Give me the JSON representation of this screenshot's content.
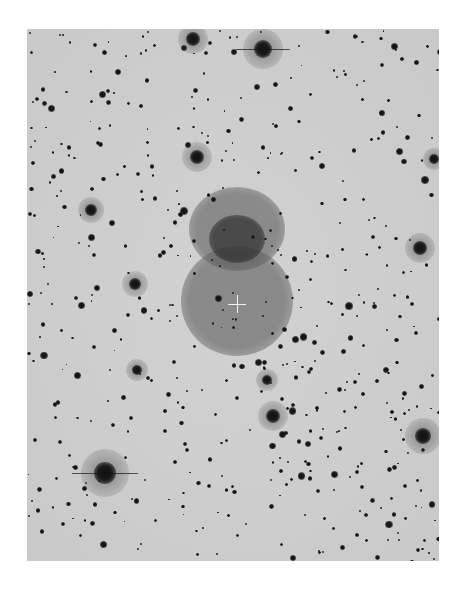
{
  "image": {
    "description": "Negative astronomical plate of a dense star field with a double-lobed diffuse nebula at center marked by a white crosshair",
    "background_color": "#cfcfcf",
    "frame": {
      "x": 27,
      "y": 29,
      "width": 412,
      "height": 532
    }
  },
  "crosshair": {
    "x": 210,
    "y": 275,
    "size": 18,
    "color": "#f2f2f2"
  },
  "nebula": [
    {
      "cx": 210,
      "cy": 200,
      "rx": 48,
      "ry": 42,
      "color": "rgba(80,80,80,0.55)"
    },
    {
      "cx": 210,
      "cy": 272,
      "rx": 56,
      "ry": 55,
      "color": "rgba(90,90,90,0.6)"
    },
    {
      "cx": 210,
      "cy": 210,
      "rx": 28,
      "ry": 24,
      "color": "rgba(40,40,40,0.65)"
    }
  ],
  "bright_stars": [
    {
      "x": 166,
      "y": 10,
      "r": 7,
      "spike": false
    },
    {
      "x": 236,
      "y": 20,
      "r": 9,
      "spike": true
    },
    {
      "x": 78,
      "y": 444,
      "r": 11,
      "spike": true
    },
    {
      "x": 170,
      "y": 128,
      "r": 7,
      "spike": false
    },
    {
      "x": 393,
      "y": 219,
      "r": 7,
      "spike": false
    },
    {
      "x": 396,
      "y": 407,
      "r": 8,
      "spike": false
    },
    {
      "x": 246,
      "y": 387,
      "r": 7,
      "spike": false
    },
    {
      "x": 64,
      "y": 181,
      "r": 6,
      "spike": false
    },
    {
      "x": 108,
      "y": 255,
      "r": 6,
      "spike": false
    },
    {
      "x": 407,
      "y": 130,
      "r": 5,
      "spike": false
    },
    {
      "x": 110,
      "y": 341,
      "r": 5,
      "spike": false
    },
    {
      "x": 240,
      "y": 351,
      "r": 5,
      "spike": false
    }
  ],
  "star_seed": 7,
  "star_count": 520
}
